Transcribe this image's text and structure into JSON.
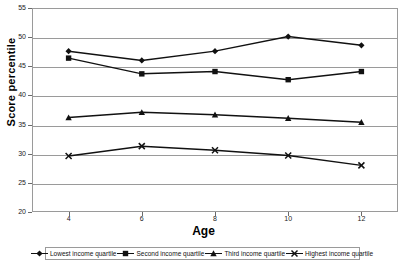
{
  "chart_data": {
    "type": "line",
    "title": "",
    "xlabel": "Age",
    "ylabel": "Score percentile",
    "x": [
      4,
      6,
      8,
      10,
      12
    ],
    "xtick_labels": [
      "4",
      "6",
      "8",
      "10",
      "12"
    ],
    "xlim": [
      3,
      13
    ],
    "ylim": [
      20,
      55
    ],
    "ytick_labels": [
      "20",
      "25",
      "30",
      "35",
      "40",
      "45",
      "50",
      "55"
    ],
    "yticks": [
      20,
      25,
      30,
      35,
      40,
      45,
      50,
      55
    ],
    "grid": "horizontal",
    "legend_position": "bottom",
    "series": [
      {
        "name": "Lowest income quartile",
        "marker": "diamond",
        "color": "#111111",
        "values": [
          47.6,
          46.0,
          47.6,
          50.1,
          48.6
        ]
      },
      {
        "name": "Second income quartile",
        "marker": "square",
        "color": "#111111",
        "values": [
          46.4,
          43.7,
          44.1,
          42.7,
          44.1
        ]
      },
      {
        "name": "Third income quartile",
        "marker": "triangle",
        "color": "#111111",
        "values": [
          36.2,
          37.1,
          36.7,
          36.1,
          35.4
        ]
      },
      {
        "name": "Highest income quartile",
        "marker": "x",
        "color": "#111111",
        "values": [
          29.6,
          31.3,
          30.6,
          29.7,
          28.0
        ]
      }
    ]
  },
  "axes": {
    "y_title": "Score percentile",
    "x_title": "Age"
  },
  "legend": {
    "entries": [
      {
        "label": "Lowest income quartile"
      },
      {
        "label": "Second income quartile"
      },
      {
        "label": "Third income quartile"
      },
      {
        "label": "Highest income quartile"
      }
    ]
  }
}
